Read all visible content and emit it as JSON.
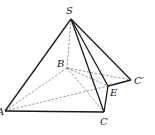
{
  "figure": {
    "type": "pyramid",
    "vertices": {
      "S": {
        "label": "S",
        "x": 71,
        "y": 19,
        "lx": 66,
        "ly": 14
      },
      "B": {
        "label": "B",
        "x": 67,
        "y": 68,
        "lx": 57,
        "ly": 67
      },
      "A": {
        "label": "A",
        "x": 5,
        "y": 111,
        "lx": -3,
        "ly": 115
      },
      "C": {
        "label": "C",
        "x": 104,
        "y": 112,
        "lx": 100,
        "ly": 125
      },
      "E": {
        "label": "E",
        "x": 108,
        "y": 86,
        "lx": 110,
        "ly": 96
      },
      "Cp": {
        "label": "C′",
        "x": 131,
        "y": 80,
        "lx": 134,
        "ly": 84
      }
    },
    "solid_edges": [
      [
        "S",
        "A"
      ],
      [
        "S",
        "C"
      ],
      [
        "S",
        "E"
      ],
      [
        "S",
        "Cp"
      ],
      [
        "A",
        "C"
      ],
      [
        "C",
        "E"
      ],
      [
        "E",
        "Cp"
      ]
    ],
    "dashed_edges": [
      [
        "S",
        "B"
      ],
      [
        "B",
        "A"
      ],
      [
        "B",
        "C"
      ],
      [
        "B",
        "Cp"
      ],
      [
        "B",
        "E"
      ],
      [
        "A",
        "E"
      ]
    ]
  }
}
